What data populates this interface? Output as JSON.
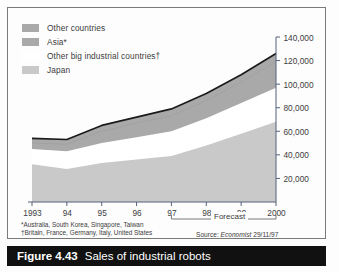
{
  "figure": {
    "caption_number": "Figure 4.43",
    "caption_title": "Sales of industrial robots"
  },
  "legend": {
    "items": [
      {
        "label": "Other countries",
        "color": "#a9a9a9"
      },
      {
        "label": "Asia*",
        "color": "#a9a9a9"
      },
      {
        "label": "Other big industrial countries†",
        "color": "#ffffff"
      },
      {
        "label": "Japan",
        "color": "#c9c9c9"
      }
    ]
  },
  "annotations": {
    "forecast_label": "Forecast",
    "footnote_1": "*Australia, South Korea, Singapore, Taiwan",
    "footnote_2": "†Britain, France, Germany, Italy, United States",
    "source_prefix": "Source:",
    "source_name": "Economist",
    "source_date": "29/11/97"
  },
  "chart_data": {
    "type": "area",
    "title": "Sales of industrial robots",
    "xlabel": "",
    "ylabel": "",
    "grid": false,
    "legend_position": "top-left",
    "yaxis_side": "right",
    "ylim": [
      0,
      140000
    ],
    "yticks": [
      20000,
      40000,
      60000,
      80000,
      100000,
      120000,
      140000
    ],
    "ytick_labels": [
      "20,000",
      "40,000",
      "60,000",
      "80,000",
      "100,000",
      "120,000",
      "140,000"
    ],
    "categories": [
      "1993",
      "94",
      "95",
      "96",
      "97",
      "98",
      "99",
      "2000"
    ],
    "x": [
      1993,
      1994,
      1995,
      1996,
      1997,
      1998,
      1999,
      2000
    ],
    "forecast_from": "97",
    "forecast_to": "2000",
    "stacked": true,
    "series": [
      {
        "name": "Japan",
        "color": "#c9c9c9",
        "values": [
          32000,
          28000,
          33000,
          36000,
          39000,
          48000,
          58000,
          68000
        ]
      },
      {
        "name": "Other big industrial countries†",
        "color": "#ffffff",
        "values": [
          13000,
          15000,
          17000,
          19000,
          21000,
          23000,
          26000,
          29000
        ]
      },
      {
        "name": "Asia*",
        "color": "#a9a9a9",
        "values": [
          5000,
          6000,
          10000,
          12000,
          13000,
          15000,
          18000,
          22000
        ]
      },
      {
        "name": "Other countries",
        "color": "#a9a9a9",
        "values": [
          4000,
          4000,
          5000,
          5000,
          6000,
          6000,
          6000,
          7000
        ]
      }
    ],
    "totals": [
      54000,
      53000,
      65000,
      72000,
      79000,
      92000,
      108000,
      126000
    ]
  }
}
